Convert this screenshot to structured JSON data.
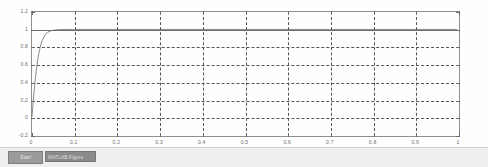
{
  "window": {
    "title": "Figure"
  },
  "taskbar": {
    "start_label": "Start",
    "task_label": "MATLAB Figure"
  },
  "chart_data": {
    "type": "line",
    "title": "",
    "xlabel": "",
    "ylabel": "",
    "xlim": [
      0,
      1
    ],
    "ylim": [
      -0.2,
      1.2
    ],
    "grid": true,
    "grid_style": "dashed",
    "legend": "none",
    "xticks": [
      0,
      0.1,
      0.2,
      0.3,
      0.4,
      0.5,
      0.6,
      0.7,
      0.8,
      0.9,
      1
    ],
    "xticklabels": [
      "0",
      "0.1",
      "0.2",
      "0.3",
      "0.4",
      "0.5",
      "0.6",
      "0.7",
      "0.8",
      "0.9",
      "1"
    ],
    "yticks": [
      -0.2,
      0,
      0.2,
      0.4,
      0.6,
      0.8,
      1,
      1.2
    ],
    "yticklabels": [
      "-0.2",
      "0",
      "0.2",
      "0.4",
      "0.6",
      "0.8",
      "1",
      "1.2"
    ],
    "series": [
      {
        "name": "step response",
        "color": "#7a7a7a",
        "x": [
          0,
          0.002,
          0.004,
          0.006,
          0.008,
          0.01,
          0.012,
          0.014,
          0.016,
          0.018,
          0.02,
          0.024,
          0.028,
          0.032,
          0.036,
          0.04,
          0.046,
          0.052,
          0.06,
          0.07,
          0.08,
          0.09,
          0.1,
          0.12,
          0.15,
          0.2,
          0.3,
          0.4,
          0.5,
          0.6,
          0.7,
          0.8,
          0.9,
          1.0
        ],
        "y": [
          0.0,
          0.125,
          0.24,
          0.345,
          0.44,
          0.525,
          0.6,
          0.666,
          0.722,
          0.77,
          0.81,
          0.872,
          0.915,
          0.944,
          0.963,
          0.975,
          0.987,
          0.993,
          0.997,
          0.999,
          1.0,
          1.0,
          1.0,
          1.0,
          1.0,
          1.0,
          1.0,
          1.0,
          1.0,
          1.0,
          1.0,
          1.0,
          1.0,
          1.0
        ]
      }
    ]
  }
}
